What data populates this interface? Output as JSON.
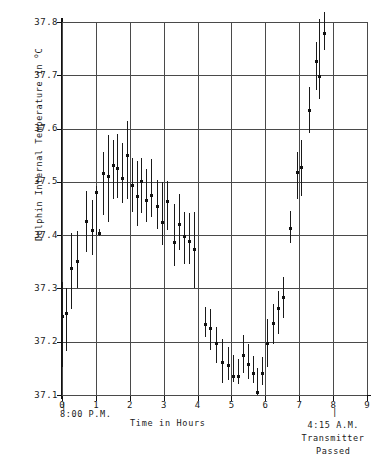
{
  "chart_data": {
    "type": "scatter",
    "title": "",
    "xlabel": "Time in Hours",
    "ylabel": "Dolphin Internal Temperature in °C",
    "ylabel_prefix": "Dolphin Internal Temperature in ",
    "ylabel_unit_sup": "o",
    "ylabel_unit": "C",
    "xlim": [
      0,
      9
    ],
    "ylim": [
      37.1,
      37.8
    ],
    "xticks": [
      0,
      1,
      2,
      3,
      4,
      5,
      6,
      7,
      8,
      9
    ],
    "xtick_labels": [
      "0",
      "1",
      "2",
      "3",
      "4",
      "5",
      "6",
      "7",
      "8",
      "9"
    ],
    "yticks": [
      37.1,
      37.2,
      37.3,
      37.4,
      37.5,
      37.6,
      37.7,
      37.8
    ],
    "ytick_labels": [
      "37.1",
      "37.2",
      "37.3",
      "37.4",
      "37.5",
      "37.6",
      "37.7",
      "37.8"
    ],
    "grid": true,
    "legend": "none",
    "error_bars": "vertical",
    "marker": "square",
    "series_name": "Dolphin internal temperature",
    "annotations": [
      {
        "id": "start-time",
        "x": 0,
        "text": "8:00 P.M.",
        "tick": "|"
      },
      {
        "id": "end-time",
        "x": 8,
        "text": "4:15 A.M.",
        "tick": "|"
      },
      {
        "id": "end-note-line1",
        "x": 8,
        "text": "Transmitter"
      },
      {
        "id": "end-note-line2",
        "x": 8,
        "text": "Passed"
      }
    ],
    "points": [
      {
        "x": 0.0,
        "y": 37.248,
        "lo": 37.152,
        "hi": 37.312
      },
      {
        "x": 0.13,
        "y": 37.253,
        "lo": 37.182,
        "hi": 37.3
      },
      {
        "x": 0.27,
        "y": 37.337,
        "lo": 37.262,
        "hi": 37.405
      },
      {
        "x": 0.43,
        "y": 37.351,
        "lo": 37.3,
        "hi": 37.407
      },
      {
        "x": 0.72,
        "y": 37.425,
        "lo": 37.368,
        "hi": 37.482
      },
      {
        "x": 0.87,
        "y": 37.409,
        "lo": 37.363,
        "hi": 37.466
      },
      {
        "x": 1.0,
        "y": 37.481,
        "lo": 37.4,
        "hi": 37.492
      },
      {
        "x": 1.09,
        "y": 37.404,
        "lo": 37.398,
        "hi": 37.412
      },
      {
        "x": 1.22,
        "y": 37.515,
        "lo": 37.437,
        "hi": 37.556
      },
      {
        "x": 1.36,
        "y": 37.511,
        "lo": 37.425,
        "hi": 37.588
      },
      {
        "x": 1.5,
        "y": 37.531,
        "lo": 37.468,
        "hi": 37.578
      },
      {
        "x": 1.63,
        "y": 37.525,
        "lo": 37.47,
        "hi": 37.589
      },
      {
        "x": 1.78,
        "y": 37.507,
        "lo": 37.46,
        "hi": 37.573
      },
      {
        "x": 1.92,
        "y": 37.549,
        "lo": 37.468,
        "hi": 37.614
      },
      {
        "x": 2.06,
        "y": 37.494,
        "lo": 37.443,
        "hi": 37.545
      },
      {
        "x": 2.2,
        "y": 37.473,
        "lo": 37.418,
        "hi": 37.539
      },
      {
        "x": 2.34,
        "y": 37.501,
        "lo": 37.442,
        "hi": 37.545
      },
      {
        "x": 2.48,
        "y": 37.466,
        "lo": 37.425,
        "hi": 37.525
      },
      {
        "x": 2.63,
        "y": 37.474,
        "lo": 37.433,
        "hi": 37.543
      },
      {
        "x": 2.8,
        "y": 37.454,
        "lo": 37.412,
        "hi": 37.503
      },
      {
        "x": 2.95,
        "y": 37.423,
        "lo": 37.382,
        "hi": 37.5
      },
      {
        "x": 3.11,
        "y": 37.464,
        "lo": 37.41,
        "hi": 37.501
      },
      {
        "x": 3.3,
        "y": 37.386,
        "lo": 37.342,
        "hi": 37.459
      },
      {
        "x": 3.45,
        "y": 37.421,
        "lo": 37.372,
        "hi": 37.478
      },
      {
        "x": 3.6,
        "y": 37.398,
        "lo": 37.346,
        "hi": 37.443
      },
      {
        "x": 3.74,
        "y": 37.389,
        "lo": 37.345,
        "hi": 37.442
      },
      {
        "x": 3.88,
        "y": 37.373,
        "lo": 37.3,
        "hi": 37.444
      },
      {
        "x": 4.22,
        "y": 37.233,
        "lo": 37.209,
        "hi": 37.265
      },
      {
        "x": 4.38,
        "y": 37.225,
        "lo": 37.185,
        "hi": 37.262
      },
      {
        "x": 4.55,
        "y": 37.196,
        "lo": 37.16,
        "hi": 37.228
      },
      {
        "x": 4.73,
        "y": 37.161,
        "lo": 37.122,
        "hi": 37.205
      },
      {
        "x": 4.9,
        "y": 37.156,
        "lo": 37.128,
        "hi": 37.19
      },
      {
        "x": 5.04,
        "y": 37.134,
        "lo": 37.124,
        "hi": 37.176
      },
      {
        "x": 5.18,
        "y": 37.134,
        "lo": 37.121,
        "hi": 37.168
      },
      {
        "x": 5.34,
        "y": 37.175,
        "lo": 37.141,
        "hi": 37.213
      },
      {
        "x": 5.48,
        "y": 37.158,
        "lo": 37.129,
        "hi": 37.196
      },
      {
        "x": 5.62,
        "y": 37.14,
        "lo": 37.122,
        "hi": 37.174
      },
      {
        "x": 5.76,
        "y": 37.104,
        "lo": 37.1,
        "hi": 37.15
      },
      {
        "x": 5.9,
        "y": 37.14,
        "lo": 37.118,
        "hi": 37.172
      },
      {
        "x": 6.06,
        "y": 37.196,
        "lo": 37.152,
        "hi": 37.243
      },
      {
        "x": 6.22,
        "y": 37.234,
        "lo": 37.196,
        "hi": 37.271
      },
      {
        "x": 6.38,
        "y": 37.263,
        "lo": 37.214,
        "hi": 37.296
      },
      {
        "x": 6.52,
        "y": 37.284,
        "lo": 37.244,
        "hi": 37.321
      },
      {
        "x": 6.72,
        "y": 37.413,
        "lo": 37.386,
        "hi": 37.445
      },
      {
        "x": 6.94,
        "y": 37.518,
        "lo": 37.468,
        "hi": 37.557
      },
      {
        "x": 7.06,
        "y": 37.527,
        "lo": 37.474,
        "hi": 37.578
      },
      {
        "x": 7.3,
        "y": 37.634,
        "lo": 37.592,
        "hi": 37.679
      },
      {
        "x": 7.48,
        "y": 37.726,
        "lo": 37.672,
        "hi": 37.763
      },
      {
        "x": 7.58,
        "y": 37.697,
        "lo": 37.656,
        "hi": 37.806
      },
      {
        "x": 7.72,
        "y": 37.778,
        "lo": 37.748,
        "hi": 37.818
      }
    ]
  }
}
